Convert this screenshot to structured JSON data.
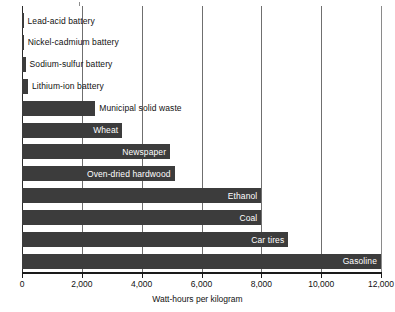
{
  "chart_data": {
    "type": "bar",
    "orientation": "horizontal",
    "title": "",
    "xlabel": "Watt-hours per kilogram",
    "ylabel": "",
    "xlim": [
      0,
      12000
    ],
    "xticks": [
      0,
      2000,
      4000,
      6000,
      8000,
      10000,
      12000
    ],
    "xtick_labels": [
      "0",
      "2,000",
      "4,000",
      "6,000",
      "8,000",
      "10,000",
      "12,000"
    ],
    "grid": true,
    "legend": "none",
    "bar_color": "#3c3c3c",
    "categories": [
      "Lead-acid battery",
      "Nickel-cadmium battery",
      "Sodium-sulfur battery",
      "Lithium-ion battery",
      "Municipal solid waste",
      "Wheat",
      "Newspaper",
      "Oven-dried hardwood",
      "Ethanol",
      "Coal",
      "Car tires",
      "Gasoline"
    ],
    "values": [
      40,
      60,
      120,
      200,
      2450,
      3350,
      4950,
      5100,
      8000,
      8000,
      8900,
      12000
    ],
    "labels_inside": [
      false,
      false,
      false,
      false,
      false,
      true,
      true,
      true,
      true,
      true,
      true,
      true
    ]
  },
  "axis": {
    "x_title": "Watt-hours per kilogram",
    "tick_0": "0",
    "tick_2000": "2,000",
    "tick_4000": "4,000",
    "tick_6000": "6,000",
    "tick_8000": "8,000",
    "tick_10000": "10,000",
    "tick_12000": "12,000"
  },
  "bars": [
    {
      "name": "Lead-acid battery",
      "label": "Lead-acid battery",
      "value": 40,
      "inside": false
    },
    {
      "name": "Nickel-cadmium battery",
      "label": "Nickel-cadmium battery",
      "value": 60,
      "inside": false
    },
    {
      "name": "Sodium-sulfur battery",
      "label": "Sodium-sulfur battery",
      "value": 120,
      "inside": false
    },
    {
      "name": "Lithium-ion battery",
      "label": "Lithium-ion battery",
      "value": 200,
      "inside": false
    },
    {
      "name": "Municipal solid waste",
      "label": "Municipal solid waste",
      "value": 2450,
      "inside": false
    },
    {
      "name": "Wheat",
      "label": "Wheat",
      "value": 3350,
      "inside": true
    },
    {
      "name": "Newspaper",
      "label": "Newspaper",
      "value": 4950,
      "inside": true
    },
    {
      "name": "Oven-dried hardwood",
      "label": "Oven-dried hardwood",
      "value": 5100,
      "inside": true
    },
    {
      "name": "Ethanol",
      "label": "Ethanol",
      "value": 8000,
      "inside": true
    },
    {
      "name": "Coal",
      "label": "Coal",
      "value": 8000,
      "inside": true
    },
    {
      "name": "Car tires",
      "label": "Car tires",
      "value": 8900,
      "inside": true
    },
    {
      "name": "Gasoline",
      "label": "Gasoline",
      "value": 12000,
      "inside": true
    }
  ]
}
